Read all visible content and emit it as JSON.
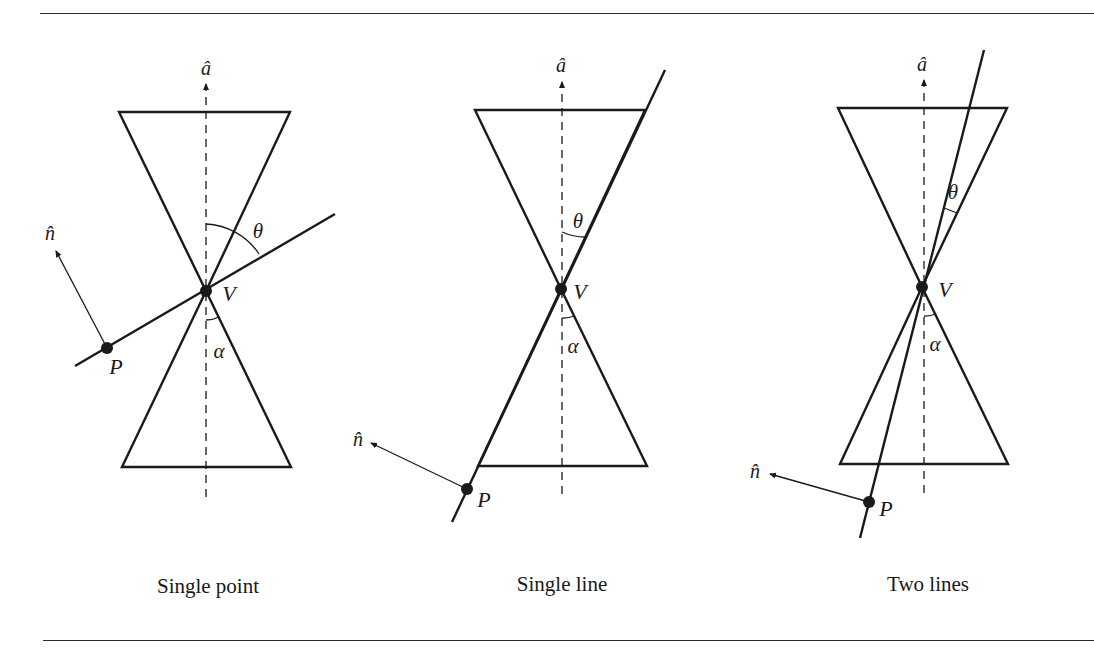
{
  "figure": {
    "colors": {
      "ink": "#1a1a1a",
      "background": "#ffffff"
    },
    "panels": [
      {
        "id": "single-point",
        "caption": "Single point",
        "labels": {
          "axis": "â",
          "normal": "n̂",
          "vertex": "V",
          "point": "P",
          "theta": "θ",
          "alpha": "α"
        }
      },
      {
        "id": "single-line",
        "caption": "Single line",
        "labels": {
          "axis": "â",
          "normal": "n̂",
          "vertex": "V",
          "point": "P",
          "theta": "θ",
          "alpha": "α"
        }
      },
      {
        "id": "two-lines",
        "caption": "Two lines",
        "labels": {
          "axis": "â",
          "normal": "n̂",
          "vertex": "V",
          "point": "P",
          "theta": "θ",
          "alpha": "α"
        }
      }
    ]
  }
}
